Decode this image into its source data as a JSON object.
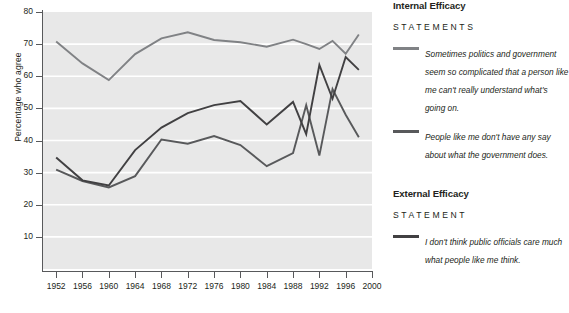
{
  "chart_data": {
    "type": "line",
    "title": "",
    "xlabel": "",
    "ylabel": "Percentage who agree",
    "xlim": [
      1950,
      2000
    ],
    "ylim": [
      0,
      80
    ],
    "ytick_values": [
      10,
      20,
      30,
      40,
      50,
      60,
      70,
      80
    ],
    "xtick_values": [
      1952,
      1956,
      1960,
      1964,
      1968,
      1972,
      1976,
      1980,
      1984,
      1988,
      1992,
      1996,
      2000
    ],
    "grid": "horizontal",
    "legend_position": "right",
    "plot_background": "#e8e8e8",
    "series": [
      {
        "name": "Sometimes politics and government seem so complicated that a person like me can't really understand what's going on.",
        "group": "Internal Efficacy",
        "color": "#808285",
        "x": [
          1952,
          1956,
          1960,
          1964,
          1968,
          1972,
          1976,
          1980,
          1984,
          1988,
          1990,
          1992,
          1994,
          1996,
          1998
        ],
        "values": [
          70.8,
          64.0,
          58.8,
          66.9,
          71.8,
          73.7,
          71.3,
          70.6,
          69.2,
          71.4,
          70.0,
          68.5,
          71.0,
          67.0,
          73.0
        ]
      },
      {
        "name": "People like me don't have any say about what the government does.",
        "group": "Internal Efficacy",
        "color": "#58595b",
        "x": [
          1952,
          1956,
          1960,
          1964,
          1968,
          1972,
          1976,
          1980,
          1984,
          1988,
          1990,
          1992,
          1994,
          1996,
          1998
        ],
        "values": [
          30.9,
          27.4,
          25.4,
          28.9,
          40.3,
          39.0,
          41.4,
          38.6,
          32.0,
          36.1,
          51.0,
          35.3,
          56.0,
          48.0,
          41.0
        ]
      },
      {
        "name": "I don't think public officials care much what people like me think.",
        "group": "External Efficacy",
        "color": "#414042",
        "x": [
          1952,
          1956,
          1960,
          1964,
          1968,
          1972,
          1976,
          1980,
          1984,
          1988,
          1990,
          1992,
          1994,
          1996,
          1998
        ],
        "values": [
          34.7,
          27.6,
          26.0,
          37.0,
          44.0,
          48.5,
          51.0,
          52.3,
          45.0,
          52.0,
          42.0,
          63.5,
          53.0,
          66.0,
          62.0
        ]
      }
    ]
  },
  "legend": {
    "internal": {
      "heading": "Internal Efficacy",
      "subheading": "STATEMENTS",
      "entries": [
        {
          "color": "#808285",
          "text": "Sometimes politics and government seem so complicated that a person like me can't really understand what's going on."
        },
        {
          "color": "#58595b",
          "text": "People like me don't have any say about what the government does."
        }
      ]
    },
    "external": {
      "heading": "External Efficacy",
      "subheading": "STATEMENT",
      "entries": [
        {
          "color": "#414042",
          "text": "I don't think public officials care much what people like me think."
        }
      ]
    }
  }
}
